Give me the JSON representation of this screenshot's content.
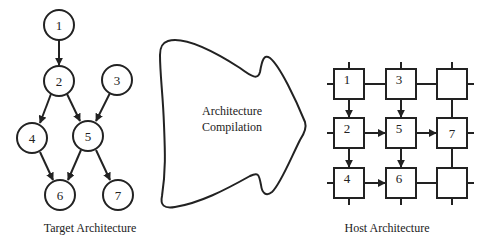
{
  "target": {
    "caption": "Target Architecture",
    "nodes": [
      {
        "id": "1",
        "label": "1",
        "cx": 59,
        "cy": 25
      },
      {
        "id": "2",
        "label": "2",
        "cx": 59,
        "cy": 81
      },
      {
        "id": "3",
        "label": "3",
        "cx": 117,
        "cy": 80
      },
      {
        "id": "4",
        "label": "4",
        "cx": 32,
        "cy": 138
      },
      {
        "id": "5",
        "label": "5",
        "cx": 88,
        "cy": 136
      },
      {
        "id": "6",
        "label": "6",
        "cx": 60,
        "cy": 195
      },
      {
        "id": "7",
        "label": "7",
        "cx": 118,
        "cy": 195
      }
    ],
    "edges": [
      [
        "1",
        "2"
      ],
      [
        "2",
        "4"
      ],
      [
        "2",
        "5"
      ],
      [
        "3",
        "5"
      ],
      [
        "4",
        "6"
      ],
      [
        "5",
        "6"
      ],
      [
        "5",
        "7"
      ]
    ]
  },
  "compiler": {
    "line1": "Architecture",
    "line2": "Compilation"
  },
  "host": {
    "caption": "Host Architecture",
    "cells": [
      {
        "row": 0,
        "col": 0,
        "label": "1"
      },
      {
        "row": 0,
        "col": 1,
        "label": "3"
      },
      {
        "row": 0,
        "col": 2,
        "label": ""
      },
      {
        "row": 1,
        "col": 0,
        "label": "2"
      },
      {
        "row": 1,
        "col": 1,
        "label": "5"
      },
      {
        "row": 1,
        "col": 2,
        "label": "7"
      },
      {
        "row": 2,
        "col": 0,
        "label": "4"
      },
      {
        "row": 2,
        "col": 1,
        "label": "6"
      },
      {
        "row": 2,
        "col": 2,
        "label": ""
      }
    ],
    "mapped_edges": [
      [
        "1",
        "2"
      ],
      [
        "3",
        "5"
      ],
      [
        "2",
        "5"
      ],
      [
        "5",
        "7"
      ],
      [
        "2",
        "4"
      ],
      [
        "5",
        "6"
      ],
      [
        "4",
        "6"
      ]
    ]
  },
  "colors": {
    "stroke": "#222222",
    "background": "#ffffff"
  }
}
